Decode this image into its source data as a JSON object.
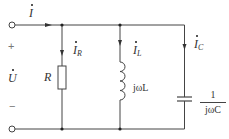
{
  "diagram": {
    "type": "parallel RLC circuit",
    "colors": {
      "wire": "#444444",
      "text": "#333333",
      "sign": "#777777"
    },
    "source": {
      "current_label": "I",
      "voltage_label": "U",
      "plus": "+",
      "minus": "−"
    },
    "branches": [
      {
        "id": "resistor",
        "current_label": "I",
        "current_sub": "R",
        "component_label": "R"
      },
      {
        "id": "inductor",
        "current_label": "I",
        "current_sub": "L",
        "component_label": "jωL"
      },
      {
        "id": "capacitor",
        "current_label": "I",
        "current_sub": "C",
        "component_num": "1",
        "component_den": "jωC"
      }
    ]
  }
}
